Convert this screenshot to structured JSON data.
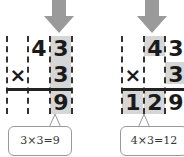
{
  "left_panel": {
    "multiplicand": [
      "",
      "4",
      "3"
    ],
    "operator": "×",
    "multiplier": [
      "",
      "",
      "3"
    ],
    "result": [
      "",
      "",
      "9"
    ],
    "callout": "3×3=9"
  },
  "right_panel": {
    "multiplicand": [
      "",
      "4",
      "3"
    ],
    "operator": "×",
    "multiplier": [
      "",
      "",
      "3"
    ],
    "result": [
      "1",
      "2",
      "9"
    ],
    "callout": "4×3=12"
  },
  "colors": {
    "arrow": "#9a9a9a",
    "shade": "#d6d6d6",
    "text": "#1a1a1a"
  }
}
